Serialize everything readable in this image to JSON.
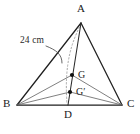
{
  "figure": {
    "kind": "tetrahedron-diagram",
    "width": 140,
    "height": 134,
    "background": "#ffffff",
    "stroke_color": "#1f1f1f",
    "hidden_stroke_color": "#9a9a9a",
    "inner_stroke_color": "#5a5a5a",
    "leader_color": "#555555",
    "point_color": "#111111"
  },
  "vertices": {
    "A": {
      "label": "A",
      "x": 81,
      "y": 23,
      "label_x": 77,
      "label_y": 3
    },
    "B": {
      "label": "B",
      "x": 17,
      "y": 105,
      "label_x": 3,
      "label_y": 98
    },
    "C": {
      "label": "C",
      "x": 122,
      "y": 105,
      "label_x": 127,
      "label_y": 98
    },
    "D": {
      "label": "D",
      "x": 68,
      "y": 105,
      "label_x": 64,
      "label_y": 109
    }
  },
  "points": {
    "G": {
      "label": "G",
      "x": 72,
      "y": 75,
      "label_x": 78,
      "label_y": 70,
      "dot_radius": 2.1
    },
    "Gprime": {
      "label": "G′",
      "x": 70,
      "y": 92,
      "label_x": 76,
      "label_y": 87,
      "dot_radius": 2.1
    }
  },
  "edges": [
    {
      "name": "edge-AB",
      "from": "A",
      "to": "B",
      "style": "solid"
    },
    {
      "name": "edge-AC",
      "from": "A",
      "to": "C",
      "style": "solid"
    },
    {
      "name": "edge-BC",
      "from": "B",
      "to": "C",
      "style": "solid"
    },
    {
      "name": "edge-AD-median",
      "from": "A",
      "to": "D",
      "style": "solid"
    },
    {
      "name": "edge-BG",
      "from": "B",
      "to": "G",
      "style": "thin"
    },
    {
      "name": "edge-CG",
      "from": "C",
      "to": "G",
      "style": "thin"
    },
    {
      "name": "edge-BGprime",
      "from": "B",
      "to": "Gprime",
      "style": "thin"
    },
    {
      "name": "edge-CGprime",
      "from": "C",
      "to": "Gprime",
      "style": "thin"
    },
    {
      "name": "edge-AD-hidden",
      "from": "A",
      "to": "D",
      "style": "dotted-curve"
    }
  ],
  "annotation": {
    "measure": {
      "text": "24 cm",
      "x": 20,
      "y": 36,
      "target_x": 62,
      "target_y": 62
    }
  }
}
